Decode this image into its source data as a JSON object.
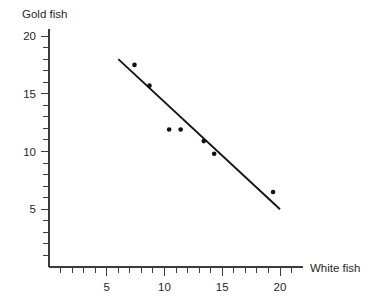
{
  "chart_data": {
    "type": "scatter",
    "title": "",
    "xlabel": "White fish",
    "ylabel": "Gold fish",
    "xlim": [
      0,
      22
    ],
    "ylim": [
      0,
      20.6
    ],
    "grid": false,
    "legend": false,
    "x_ticks_major": [
      5,
      10,
      15,
      20
    ],
    "y_ticks_major": [
      5,
      10,
      15,
      20
    ],
    "x_tick_labels": [
      "5",
      "10",
      "15",
      "20"
    ],
    "y_tick_labels": [
      "5",
      "10",
      "15",
      "20"
    ],
    "x_minor_step": 1,
    "y_minor_step": 1,
    "x_minor_max": 21,
    "y_minor_max": 20,
    "points": [
      {
        "x": 7.4,
        "y": 17.5
      },
      {
        "x": 8.7,
        "y": 15.7
      },
      {
        "x": 10.4,
        "y": 11.9
      },
      {
        "x": 11.4,
        "y": 11.9
      },
      {
        "x": 13.4,
        "y": 10.9
      },
      {
        "x": 14.3,
        "y": 9.8
      },
      {
        "x": 19.4,
        "y": 6.5
      }
    ],
    "trend_line": {
      "x1": 6.0,
      "y1": 18.0,
      "x2": 20.0,
      "y2": 5.0
    },
    "marker_radius": 2.3,
    "colors": {
      "point": "#101010",
      "line": "#141414",
      "axis": "#3b3b3b",
      "text": "#1f1f1f",
      "background": "#ffffff"
    }
  }
}
